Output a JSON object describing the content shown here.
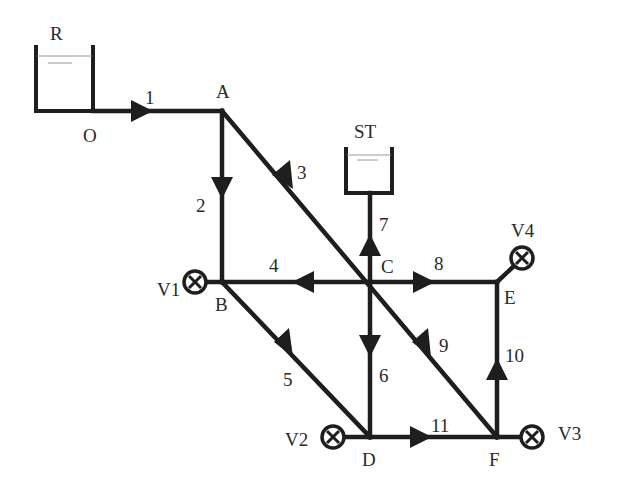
{
  "diagram": {
    "type": "pipe-network",
    "reservoirs": [
      {
        "id": "R",
        "label": "R"
      },
      {
        "id": "ST",
        "label": "ST"
      }
    ],
    "nodes": [
      {
        "id": "O",
        "label": "O"
      },
      {
        "id": "A",
        "label": "A"
      },
      {
        "id": "B",
        "label": "B"
      },
      {
        "id": "C",
        "label": "C"
      },
      {
        "id": "D",
        "label": "D"
      },
      {
        "id": "E",
        "label": "E"
      },
      {
        "id": "F",
        "label": "F"
      }
    ],
    "valves": [
      {
        "id": "V1",
        "label": "V1",
        "node": "B"
      },
      {
        "id": "V2",
        "label": "V2",
        "node": "D"
      },
      {
        "id": "V3",
        "label": "V3",
        "node": "F"
      },
      {
        "id": "V4",
        "label": "V4",
        "node": "E"
      }
    ],
    "pipes": [
      {
        "label": "1",
        "from": "O",
        "to": "A"
      },
      {
        "label": "2",
        "from": "A",
        "to": "B"
      },
      {
        "label": "3",
        "from": "A",
        "to": "C"
      },
      {
        "label": "4",
        "from": "C",
        "to": "B"
      },
      {
        "label": "5",
        "from": "B",
        "to": "D"
      },
      {
        "label": "6",
        "from": "C",
        "to": "D"
      },
      {
        "label": "7",
        "from": "C",
        "to": "ST"
      },
      {
        "label": "8",
        "from": "C",
        "to": "E"
      },
      {
        "label": "9",
        "from": "C",
        "to": "F"
      },
      {
        "label": "10",
        "from": "F",
        "to": "E"
      },
      {
        "label": "11",
        "from": "D",
        "to": "F"
      }
    ]
  }
}
